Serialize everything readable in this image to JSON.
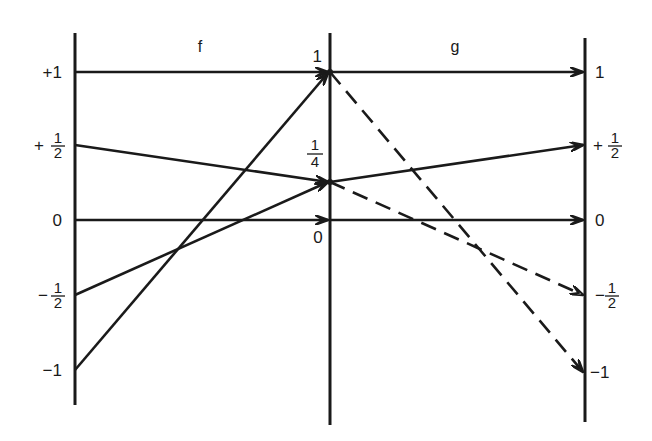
{
  "diagram": {
    "function_labels": {
      "f": "f",
      "g": "g"
    },
    "left_axis": {
      "ticks": [
        {
          "label": "+1",
          "value": 1
        },
        {
          "label_sign": "+",
          "num": "1",
          "den": "2",
          "value": 0.5
        },
        {
          "label": "0",
          "value": 0
        },
        {
          "label_sign": "−",
          "num": "1",
          "den": "2",
          "value": -0.5
        },
        {
          "label": "−1",
          "value": -1
        }
      ]
    },
    "middle_axis": {
      "ticks": [
        {
          "label": "1",
          "value": 1
        },
        {
          "num": "1",
          "den": "4",
          "value": 0.25
        },
        {
          "label": "0",
          "value": 0
        }
      ]
    },
    "right_axis": {
      "ticks": [
        {
          "label": "1",
          "value": 1
        },
        {
          "label_sign": "+",
          "num": "1",
          "den": "2",
          "value": 0.5
        },
        {
          "label": "0",
          "value": 0
        },
        {
          "label_sign": "−",
          "num": "1",
          "den": "2",
          "value": -0.5
        },
        {
          "label": "−1",
          "value": -1
        }
      ]
    },
    "f_mappings": [
      {
        "from": 1,
        "to": 1,
        "style": "solid"
      },
      {
        "from": 0.5,
        "to": 0.25,
        "style": "solid"
      },
      {
        "from": 0,
        "to": 0,
        "style": "solid"
      },
      {
        "from": -0.5,
        "to": 0.25,
        "style": "solid"
      },
      {
        "from": -1,
        "to": 1,
        "style": "solid"
      }
    ],
    "g_mappings": [
      {
        "from": 1,
        "to": 1,
        "style": "solid"
      },
      {
        "from": 0.25,
        "to": 0.5,
        "style": "solid"
      },
      {
        "from": 0,
        "to": 0,
        "style": "solid"
      },
      {
        "from": 0.25,
        "to": -0.5,
        "style": "dashed"
      },
      {
        "from": 1,
        "to": -1,
        "style": "dashed"
      }
    ],
    "colors": {
      "ink": "#1a1a1a",
      "background": "#ffffff"
    }
  }
}
